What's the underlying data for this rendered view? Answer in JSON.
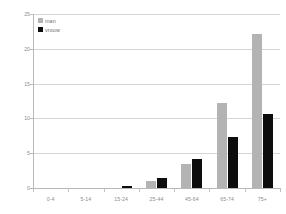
{
  "chart_data": {
    "type": "bar",
    "title": "",
    "subtitle": "",
    "xlabel": "",
    "ylabel": "",
    "categories": [
      "0-4",
      "5-14",
      "15-24",
      "25-44",
      "45-64",
      "65-74",
      "75+"
    ],
    "series": [
      {
        "name": "man",
        "color": "#b3b3b3",
        "values": [
          0,
          0,
          0,
          1.0,
          3.5,
          12.2,
          22.1
        ]
      },
      {
        "name": "vrouw",
        "color": "#0d0d0d",
        "values": [
          0,
          0,
          0.3,
          1.5,
          4.1,
          7.4,
          10.6
        ]
      }
    ],
    "ylim": [
      0,
      25
    ],
    "yticks": [
      0,
      5,
      10,
      15,
      20,
      25
    ],
    "ytick_labels": [
      "0",
      "5",
      "10",
      "15",
      "20",
      "25"
    ],
    "grid": true,
    "grid_axis": "y",
    "legend_position": "upper-left",
    "axis_color": "#b9b9b9",
    "grid_color": "#d6d6d6",
    "tick_label_color": "#8d8d8d",
    "background": "#ffffff"
  }
}
